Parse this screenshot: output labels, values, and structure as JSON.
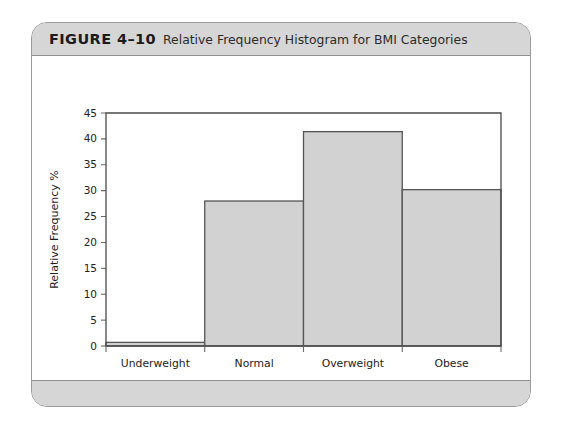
{
  "figure": {
    "number_label": "FIGURE 4–10",
    "title": "Relative Frequency Histogram for BMI Categories"
  },
  "colors": {
    "card_border": "#9a9a9a",
    "caption_band": "#d6d6d6",
    "bar_fill": "#d2d2d2",
    "bar_stroke": "#555555",
    "axis": "#4a4a4a"
  },
  "chart_data": {
    "type": "bar",
    "title": "Relative Frequency Histogram for BMI Categories",
    "categories": [
      "Underweight",
      "Normal",
      "Overweight",
      "Obese"
    ],
    "values": [
      0.7,
      28.0,
      41.4,
      30.2
    ],
    "xlabel": "BMI",
    "ylabel": "Relative Frequency %",
    "ylim": [
      0,
      45
    ],
    "ytick_step": 5,
    "yticks": [
      0,
      5,
      10,
      15,
      20,
      25,
      30,
      35,
      40,
      45
    ],
    "ytick_labels": [
      "0",
      "5",
      "10",
      "15",
      "20",
      "25",
      "30",
      "35",
      "40",
      "45"
    ],
    "grid": false,
    "legend": false,
    "bar_gap": 0,
    "series": [
      {
        "name": "Relative Frequency %",
        "values": [
          0.7,
          28.0,
          41.4,
          30.2
        ]
      }
    ]
  }
}
